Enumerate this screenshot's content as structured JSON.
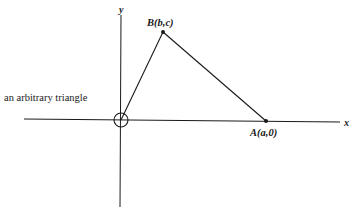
{
  "caption": "an arbitrary triangle",
  "axes": {
    "x_label": "x",
    "y_label": "y"
  },
  "points": {
    "A": {
      "label": "A(a,0)",
      "name": "A",
      "coords": "(a,0)"
    },
    "B": {
      "label": "B(b,c)",
      "name": "B",
      "coords": "(b,c)"
    },
    "O": {
      "marker": "circle-at-origin"
    }
  },
  "colors": {
    "line": "#1a1a1a",
    "background": "#ffffff"
  }
}
